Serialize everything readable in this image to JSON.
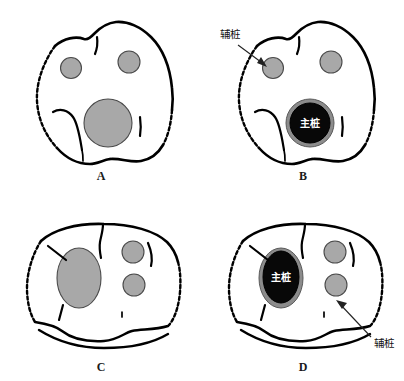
{
  "figure": {
    "background_color": "#ffffff",
    "width": 404,
    "height": 381,
    "type": "dental-cross-section-diagram",
    "panel_count": 4
  },
  "colors": {
    "outline": "#000000",
    "canal_fill": "#a8a8a8",
    "post_fill": "#000000",
    "post_ring": "#8c8c8c",
    "label_text": "#111111",
    "inner_label_text": "#ffffff",
    "background": "#ffffff"
  },
  "panels": [
    {
      "id": "panel-a",
      "letter": "A",
      "letter_x": 101,
      "letter_y": 180,
      "description": "molar cross-section with three empty root canals",
      "labels": []
    },
    {
      "id": "panel-b",
      "letter": "B",
      "letter_x": 303,
      "letter_y": 180,
      "description": "molar cross-section with main post placed in large canal",
      "labels": [
        {
          "name": "auxiliary-post-label",
          "text": "辅桩",
          "x": 230,
          "y": 38,
          "arrow_from_x": 238,
          "arrow_from_y": 44,
          "arrow_to_x": 266,
          "arrow_to_y": 66
        },
        {
          "name": "main-post-label",
          "text": "主桩",
          "x": 303,
          "y": 125
        }
      ]
    },
    {
      "id": "panel-c",
      "letter": "C",
      "letter_x": 101,
      "letter_y": 371,
      "description": "molar cross-section with oval canal and two round canals",
      "labels": []
    },
    {
      "id": "panel-d",
      "letter": "D",
      "letter_x": 303,
      "letter_y": 371,
      "description": "molar cross-section with main post in oval canal and auxiliary canals",
      "labels": [
        {
          "name": "main-post-label",
          "text": "主桩",
          "x": 282,
          "y": 272
        },
        {
          "name": "auxiliary-post-label",
          "text": "辅桩",
          "x": 384,
          "y": 345,
          "arrow_from_x": 372,
          "arrow_from_y": 336,
          "arrow_to_x": 337,
          "arrow_to_y": 302
        }
      ]
    }
  ],
  "legend_terms": {
    "main_post": "主桩",
    "auxiliary_post": "辅桩"
  }
}
